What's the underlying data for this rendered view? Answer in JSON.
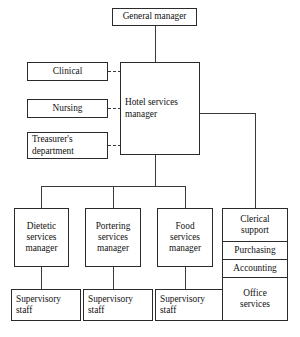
{
  "diagram": {
    "type": "org-chart",
    "line_color": "#3a3a3a",
    "border_color": "#2b2b2b",
    "background": "#ffffff"
  },
  "nodes": {
    "general_manager": "General manager",
    "hotel_services_manager": "Hotel services\nmanager",
    "clinical": "Clinical",
    "nursing": "Nursing",
    "treasurers_department": "Treasurer's\ndepartment",
    "dietetic_services_manager": "Dietetic\nservices\nmanager",
    "portering_services_manager": "Portering\nservices\nmanager",
    "food_services_manager": "Food\nservices\nmanager",
    "supervisory_staff_dietetic": "Supervisory\nstaff",
    "supervisory_staff_portering": "Supervisory\nstaff",
    "supervisory_staff_food": "Supervisory\nstaff",
    "clerical_support": "Clerical\nsupport",
    "purchasing": "Purchasing",
    "accounting": "Accounting",
    "office_services": "Office\nservices"
  }
}
